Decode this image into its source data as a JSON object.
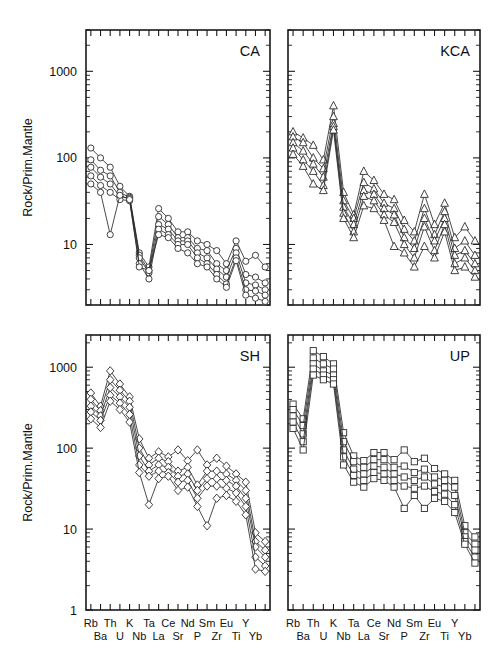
{
  "figure": {
    "type": "multi-panel-spider-diagram",
    "panel_count": 4,
    "ylabel": "Rock/Prim.Mantle"
  },
  "chart_data": [
    {
      "type": "line",
      "title": "CA",
      "panel": "top-left",
      "marker": "circle",
      "xlabel": "",
      "ylabel": "Rock/Prim.Mantle",
      "ylim": [
        2,
        3000
      ],
      "yscale": "log",
      "ytick_labels": [
        "10",
        "100",
        "1000"
      ],
      "ytick_values": [
        10,
        100,
        1000
      ],
      "grid": false,
      "legend": "none",
      "categories": [
        "Rb",
        "Ba",
        "Th",
        "U",
        "K",
        "Nb",
        "Ta",
        "La",
        "Ce",
        "Sr",
        "Nd",
        "P",
        "Sm",
        "Zr",
        "Eu",
        "Ti",
        "Y",
        "Yb"
      ],
      "categories_top": [
        "Rb",
        "Th",
        "K",
        "Ta",
        "Ce",
        "Sr",
        "P",
        "Zr",
        "Ti",
        "Yb"
      ],
      "categories_bottom": [
        "Ba",
        "U",
        "Nb",
        "La",
        "Nd",
        "Sm",
        "Eu",
        "Y"
      ],
      "series": [
        {
          "name": "CA-1",
          "values": [
            130,
            100,
            78,
            47,
            36,
            8.0,
            5.5,
            26,
            20,
            14,
            14,
            11,
            10,
            8.5,
            6.0,
            11,
            6.4,
            7.5,
            5.5
          ]
        },
        {
          "name": "CA-2",
          "values": [
            95,
            72,
            62,
            40,
            35,
            7.5,
            5.0,
            21,
            17,
            12,
            12,
            9.0,
            8.5,
            6.0,
            5.0,
            9.0,
            4.5,
            4.2,
            3.6
          ]
        },
        {
          "name": "CA-3",
          "values": [
            78,
            60,
            50,
            36,
            34,
            7.0,
            4.7,
            17,
            15,
            11,
            11,
            8.0,
            7.0,
            5.2,
            4.2,
            8.0,
            3.6,
            3.4,
            3.0
          ]
        },
        {
          "name": "CA-4",
          "values": [
            62,
            48,
            40,
            33,
            32,
            6.0,
            4.0,
            15,
            13,
            10,
            10,
            7.0,
            6.0,
            4.5,
            3.5,
            7.0,
            3.0,
            2.9,
            2.6
          ]
        },
        {
          "name": "CA-5",
          "values": [
            50,
            40,
            13,
            37,
            33,
            5.5,
            5.0,
            13,
            12,
            9.0,
            8.0,
            6.0,
            5.5,
            4.0,
            3.2,
            6.5,
            2.6,
            2.4,
            2.2
          ]
        }
      ]
    },
    {
      "type": "line",
      "title": "KCA",
      "panel": "top-right",
      "marker": "triangle",
      "xlabel": "",
      "ylabel": "",
      "ylim": [
        2,
        3000
      ],
      "yscale": "log",
      "ytick_labels": [],
      "ytick_values": [
        10,
        100,
        1000
      ],
      "grid": false,
      "legend": "none",
      "categories": [
        "Rb",
        "Ba",
        "Th",
        "U",
        "K",
        "Nb",
        "Ta",
        "La",
        "Ce",
        "Sr",
        "Nd",
        "P",
        "Sm",
        "Zr",
        "Eu",
        "Ti",
        "Y",
        "Yb"
      ],
      "series": [
        {
          "name": "KCA-1",
          "values": [
            200,
            170,
            140,
            95,
            400,
            40,
            22,
            70,
            55,
            38,
            33,
            19,
            14,
            38,
            17,
            30,
            12,
            16,
            11
          ]
        },
        {
          "name": "KCA-2",
          "values": [
            175,
            150,
            100,
            75,
            300,
            32,
            20,
            52,
            44,
            30,
            26,
            15,
            11,
            26,
            13,
            24,
            9.0,
            11,
            7.5
          ]
        },
        {
          "name": "KCA-3",
          "values": [
            150,
            120,
            85,
            60,
            250,
            27,
            17,
            42,
            38,
            26,
            22,
            12,
            9.0,
            20,
            11,
            20,
            7.5,
            8.5,
            6.0
          ]
        },
        {
          "name": "KCA-4",
          "values": [
            130,
            95,
            70,
            48,
            230,
            23,
            14,
            36,
            32,
            22,
            18,
            10,
            7.0,
            16,
            8.5,
            17,
            6.0,
            7.0,
            5.0
          ]
        },
        {
          "name": "KCA-5",
          "values": [
            110,
            80,
            50,
            42,
            210,
            20,
            12,
            28,
            26,
            19,
            9.5,
            8.0,
            5.5,
            9.5,
            7.0,
            14,
            5.0,
            5.5,
            4.2
          ]
        }
      ]
    },
    {
      "type": "line",
      "title": "SH",
      "panel": "bottom-left",
      "marker": "diamond",
      "xlabel": "",
      "ylabel": "Rock/Prim.Mantle",
      "ylim": [
        1,
        2500
      ],
      "yscale": "log",
      "ytick_labels": [
        "1",
        "10",
        "100",
        "1000"
      ],
      "ytick_values": [
        1,
        10,
        100,
        1000
      ],
      "grid": false,
      "legend": "none",
      "categories": [
        "Rb",
        "Ba",
        "Th",
        "U",
        "K",
        "Nb",
        "Ta",
        "La",
        "Ce",
        "Sr",
        "Nd",
        "P",
        "Sm",
        "Zr",
        "Eu",
        "Ti",
        "Y",
        "Yb"
      ],
      "series": [
        {
          "name": "SH-1",
          "values": [
            480,
            330,
            900,
            620,
            430,
            130,
            75,
            90,
            78,
            95,
            70,
            95,
            62,
            75,
            60,
            48,
            38,
            9.0,
            7.0
          ]
        },
        {
          "name": "SH-2",
          "values": [
            400,
            290,
            700,
            520,
            380,
            100,
            62,
            75,
            68,
            52,
            58,
            35,
            52,
            52,
            48,
            40,
            30,
            7.0,
            5.5
          ]
        },
        {
          "name": "SH-3",
          "values": [
            330,
            250,
            560,
            430,
            320,
            80,
            52,
            62,
            58,
            45,
            48,
            30,
            42,
            42,
            40,
            34,
            24,
            6.0,
            4.5
          ]
        },
        {
          "name": "SH-4",
          "values": [
            280,
            220,
            450,
            360,
            260,
            62,
            45,
            52,
            50,
            38,
            40,
            24,
            34,
            34,
            32,
            28,
            19,
            4.5,
            3.5
          ]
        },
        {
          "name": "SH-5",
          "values": [
            230,
            180,
            380,
            300,
            210,
            50,
            20,
            42,
            45,
            30,
            33,
            19,
            11,
            24,
            26,
            22,
            15,
            3.2,
            3.0
          ]
        }
      ]
    },
    {
      "type": "line",
      "title": "UP",
      "panel": "bottom-right",
      "marker": "square",
      "xlabel": "",
      "ylabel": "",
      "ylim": [
        1,
        2500
      ],
      "yscale": "log",
      "ytick_labels": [],
      "ytick_values": [
        1,
        10,
        100,
        1000
      ],
      "grid": false,
      "legend": "none",
      "categories": [
        "Rb",
        "Ba",
        "Th",
        "U",
        "K",
        "Nb",
        "Ta",
        "La",
        "Ce",
        "Sr",
        "Nd",
        "P",
        "Sm",
        "Zr",
        "Eu",
        "Ti",
        "Y",
        "Yb"
      ],
      "series": [
        {
          "name": "UP-1",
          "values": [
            350,
            230,
            1600,
            1350,
            1100,
            155,
            80,
            70,
            88,
            88,
            72,
            95,
            68,
            75,
            56,
            48,
            40,
            11,
            8.0
          ]
        },
        {
          "name": "UP-2",
          "values": [
            300,
            190,
            1300,
            1100,
            950,
            120,
            68,
            58,
            72,
            72,
            58,
            60,
            50,
            55,
            44,
            40,
            33,
            9.0,
            6.5
          ]
        },
        {
          "name": "UP-3",
          "values": [
            250,
            150,
            1100,
            900,
            800,
            95,
            55,
            48,
            60,
            58,
            48,
            44,
            40,
            44,
            36,
            33,
            26,
            8.0,
            5.5
          ]
        },
        {
          "name": "UP-4",
          "values": [
            210,
            120,
            950,
            800,
            700,
            78,
            46,
            40,
            50,
            48,
            40,
            34,
            32,
            34,
            29,
            27,
            20,
            7.0,
            4.5
          ]
        },
        {
          "name": "UP-5",
          "values": [
            175,
            95,
            800,
            700,
            620,
            62,
            38,
            33,
            42,
            40,
            33,
            18,
            26,
            18,
            24,
            22,
            16,
            6.5,
            3.8
          ]
        }
      ]
    }
  ]
}
